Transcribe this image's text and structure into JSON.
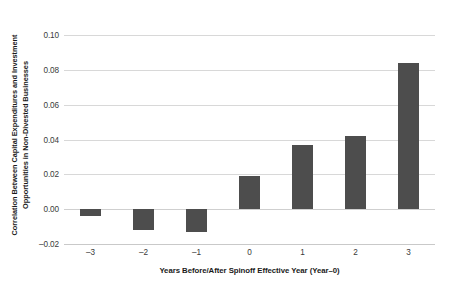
{
  "chart_data": {
    "type": "bar",
    "title": "",
    "subtitle": "",
    "xlabel": "Years Before/After Spinoff Effective Year (Year–0)",
    "ylabel": "Correlation Between Capital Expenditures and Investment Opportunities in Non-Divested Businesses",
    "ylabel_lines": [
      "Correlation Between Capital Expenditures and Investment",
      "Opportunities in Non-Divested Businesses"
    ],
    "categories": [
      "–3",
      "–2",
      "–1",
      "0",
      "1",
      "2",
      "3"
    ],
    "values": [
      -0.004,
      -0.012,
      -0.013,
      0.019,
      0.037,
      0.042,
      0.084
    ],
    "ylim": [
      -0.02,
      0.1
    ],
    "yticks": [
      0.1,
      0.08,
      0.06,
      0.04,
      0.02,
      0.0,
      -0.02
    ],
    "ytick_labels": [
      "0.10",
      "0.08",
      "0.06",
      "0.04",
      "0.02",
      "0.00",
      "–0.02"
    ],
    "xtick_labels": [
      "–3",
      "–2",
      "–1",
      "0",
      "1",
      "2",
      "3"
    ],
    "grid": true,
    "grid_axis": "y",
    "legend": false,
    "legend_position": "none",
    "bar_color": "#4d4d4d",
    "grid_color": "#d8d8d8",
    "background_color": "#ffffff",
    "text_color": "#1a1a1a"
  }
}
